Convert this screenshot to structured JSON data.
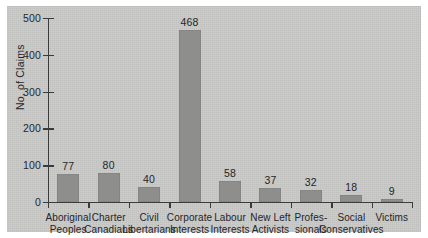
{
  "chart_data": {
    "type": "bar",
    "title": "",
    "xlabel": "",
    "ylabel": "No. of Claims",
    "ylim": [
      0,
      500
    ],
    "yticks": [
      0,
      100,
      200,
      300,
      400,
      500
    ],
    "ytick_labels": [
      "0",
      "100",
      "200",
      "300",
      "400",
      "500"
    ],
    "grid": false,
    "legend": "none",
    "bar_color": "#8e8e8c",
    "background_color": "#c9c9c7",
    "axis_color": "#3a3a38",
    "text_color": "#25252a",
    "categories": [
      "Aboriginal\nPeoples",
      "Charter\nCanadians",
      "Civil\nLibertarians",
      "Corporate\nInterests",
      "Labour\nInterests",
      "New Left\nActivists",
      "Profes-\nsionals",
      "Social\nConservatives",
      "Victims"
    ],
    "category_lines": [
      [
        "Aboriginal",
        "Peoples"
      ],
      [
        "Charter",
        "Canadians"
      ],
      [
        "Civil",
        "Libertarians"
      ],
      [
        "Corporate",
        "Interests"
      ],
      [
        "Labour",
        "Interests"
      ],
      [
        "New Left",
        "Activists"
      ],
      [
        "Profes-",
        "sionals"
      ],
      [
        "Social",
        "Conservatives"
      ],
      [
        "Victims",
        ""
      ]
    ],
    "values": [
      77,
      80,
      40,
      468,
      58,
      37,
      32,
      18,
      9
    ],
    "value_labels": [
      "77",
      "80",
      "40",
      "468",
      "58",
      "37",
      "32",
      "18",
      "9"
    ]
  }
}
